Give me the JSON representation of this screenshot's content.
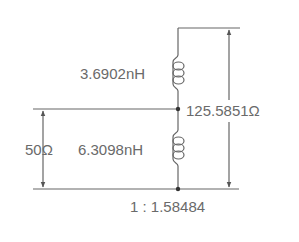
{
  "diagram": {
    "labels": {
      "l_top": "3.6902nH",
      "l_bottom": "6.3098nH",
      "r_source": "50Ω",
      "r_load": "125.5851Ω",
      "ratio": "1 : 1.58484"
    },
    "colors": {
      "line": "#555555",
      "text": "#6a6a6a"
    },
    "components": [
      {
        "type": "inductor",
        "name": "top-inductor",
        "value": "3.6902nH"
      },
      {
        "type": "inductor",
        "name": "bottom-inductor",
        "value": "6.3098nH"
      },
      {
        "type": "port",
        "name": "source-port",
        "impedance": "50Ω"
      },
      {
        "type": "port",
        "name": "load-port",
        "impedance": "125.5851Ω"
      }
    ]
  }
}
